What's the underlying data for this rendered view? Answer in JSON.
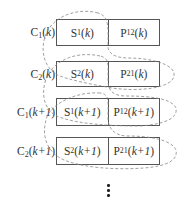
{
  "diagram": {
    "rows": [
      {
        "label": {
          "base": "C",
          "sub": "1",
          "arg": "k"
        },
        "cells": [
          {
            "base": "S",
            "sub": "1",
            "arg": "k"
          },
          {
            "base": "P",
            "sub": "12",
            "arg": "k"
          }
        ]
      },
      {
        "label": {
          "base": "C",
          "sub": "2",
          "arg": "k"
        },
        "cells": [
          {
            "base": "S",
            "sub": "2",
            "arg": "k"
          },
          {
            "base": "P",
            "sub": "21",
            "arg": "k"
          }
        ]
      },
      {
        "label": {
          "base": "C",
          "sub": "1",
          "arg": "k+1"
        },
        "cells": [
          {
            "base": "S",
            "sub": "1",
            "arg": "k+1"
          },
          {
            "base": "P",
            "sub": "12",
            "arg": "k+1"
          }
        ]
      },
      {
        "label": {
          "base": "C",
          "sub": "2",
          "arg": "k+1"
        },
        "cells": [
          {
            "base": "S",
            "sub": "2",
            "arg": "k+1"
          },
          {
            "base": "P",
            "sub": "21",
            "arg": "k+1"
          }
        ]
      }
    ],
    "continuation": "⋮",
    "colors": {
      "box_border": "#555555",
      "dashed_curve": "#888888",
      "text": "#333333"
    }
  }
}
